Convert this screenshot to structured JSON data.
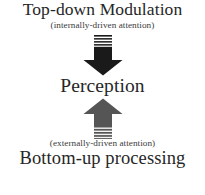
{
  "diagram": {
    "background_color": "#ffffff",
    "text_color": "#262626",
    "subtitle_color": "#3a3a3a",
    "top": {
      "title": "Top-down Modulation",
      "subtitle": "(internally-driven attention)"
    },
    "center": {
      "title": "Perception"
    },
    "bottom": {
      "subtitle": "(externally-driven attention)",
      "title": "Bottom-up processing"
    },
    "arrows": {
      "down": {
        "name": "down-arrow-icon",
        "direction": "down",
        "color": "#1a1a1a",
        "stripe_color": "#ffffff",
        "stripe_count": 3,
        "meaning": "top-down modulation flows into perception"
      },
      "up": {
        "name": "up-arrow-icon",
        "direction": "up",
        "color": "#555555",
        "stripe_color": "#f2f2f2",
        "stripe_count": 3,
        "meaning": "bottom-up processing flows into perception"
      }
    }
  }
}
